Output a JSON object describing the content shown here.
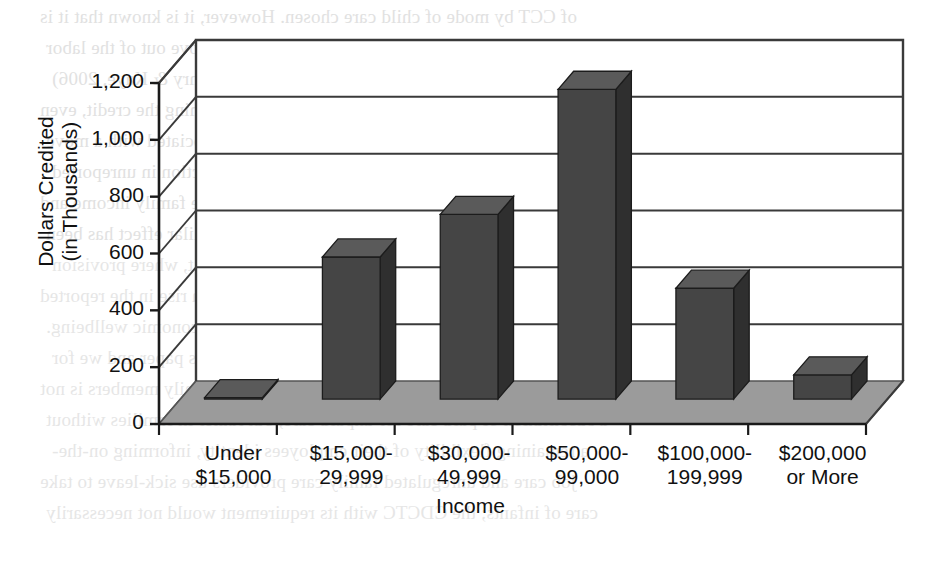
{
  "chart_data": {
    "type": "bar",
    "title": "",
    "xlabel": "Income",
    "ylabel": "Dollars Credited (in Thousands)",
    "ylabel_line1": "Dollars Credited",
    "ylabel_line2": "(in Thousands)",
    "categories": [
      "Under $15,000",
      "$15,000-29,999",
      "$30,000-49,999",
      "$50,000-99,000",
      "$100,000-199,999",
      "$200,000 or More"
    ],
    "category_lines": [
      [
        "Under",
        "$15,000"
      ],
      [
        "$15,000-",
        "29,999"
      ],
      [
        "$30,000-",
        "49,999"
      ],
      [
        "$50,000-",
        "99,000"
      ],
      [
        "$100,000-",
        "199,999"
      ],
      [
        "$200,000",
        "or More"
      ]
    ],
    "values": [
      5,
      500,
      650,
      1090,
      390,
      85
    ],
    "ylim": [
      0,
      1200
    ],
    "yticks": [
      0,
      200,
      400,
      600,
      800,
      1000,
      1200
    ],
    "ytick_labels": [
      "0",
      "200",
      "400",
      "600",
      "800",
      "1,000",
      "1,200"
    ],
    "grid": true,
    "legend": false,
    "style": "3d-column",
    "colors": {
      "bar_front": "#454545",
      "bar_top": "#5a5a5a",
      "bar_side": "#2f2f2f",
      "floor": "#9b9b9b",
      "floor_edge": "#6e6e6e",
      "wall": "#ffffff",
      "gridline": "#3a3a3a",
      "axis": "#1a1a1a",
      "text": "#111111"
    }
  },
  "background_text": {
    "note": "faint mirrored bleed-through from reverse side of scanned page",
    "lines": [
      "of CCT by mode of child care chosen. However, it is known that it is",
      "unlikely that parents will use the new credit to move out of the labor",
      "force (Smeeding & Phillips, 2000; Holtz, 2002; Henry & Kaye, 2006)",
      "and that employment is a condition for claiming the credit, even",
      "when income is not. Since the CDCTC may be associated with a move",
      "from informal to formal child care and a reduction in unreported",
      "earnings, it may produce a slight increase in taxable family income and",
      "a small but formal earnings penalty. A similar effect has been",
      "previously identified for the Earned Income Tax Credit, where provision",
      "and 42% of the credit value is fixed, producing a rise in the reported",
      "taxation of income but not in the measures of family economic wellbeing.",
      "Testing for such problems is beyond the scope of this paper and we for",
      "It is important to note that the decision to help family members is not",
      "a substitution of paid care for unpaid care, but rather in families without",
      "a remaining flexibility of their employees identity, informing on-the-",
      "job care and unregulated family care providers use sick-leave to take",
      "care of infants; the CDCTC with its requirement would not necessarily"
    ]
  }
}
